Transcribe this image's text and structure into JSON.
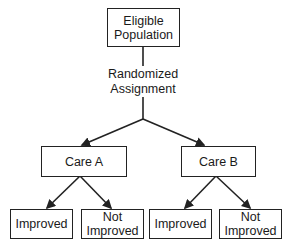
{
  "diagram": {
    "type": "flowchart",
    "root": {
      "label_line1": "Eligible",
      "label_line2": "Population"
    },
    "edge_label": {
      "line1": "Randomized",
      "line2": "Assignment"
    },
    "arms": [
      {
        "label": "Care A",
        "outcomes": [
          {
            "line1": "Improved",
            "line2": ""
          },
          {
            "line1": "Not",
            "line2": "Improved"
          }
        ]
      },
      {
        "label": "Care B",
        "outcomes": [
          {
            "line1": "Improved",
            "line2": ""
          },
          {
            "line1": "Not",
            "line2": "Improved"
          }
        ]
      }
    ]
  }
}
